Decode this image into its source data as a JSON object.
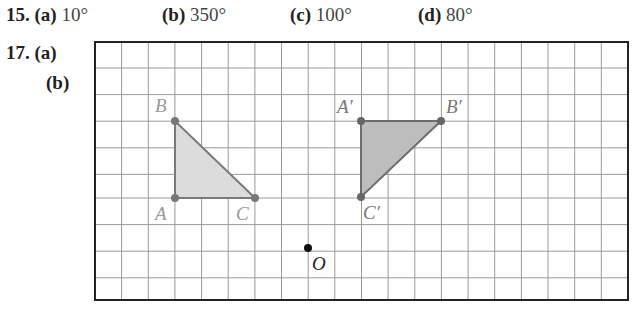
{
  "problem15": {
    "number": "15.",
    "parts": [
      {
        "label": "(a)",
        "answer": "10°"
      },
      {
        "label": "(b)",
        "answer": "350°"
      },
      {
        "label": "(c)",
        "answer": "100°"
      },
      {
        "label": "(d)",
        "answer": "80°"
      }
    ]
  },
  "problem17": {
    "number": "17.",
    "parts": [
      {
        "label": "(a)"
      },
      {
        "label": "(b)"
      }
    ]
  },
  "figure": {
    "grid": {
      "columns": 20,
      "rows": 10
    },
    "triangle_original": {
      "fill": "#dcdcdc",
      "points": [
        {
          "name": "A",
          "label": "A"
        },
        {
          "name": "B",
          "label": "B"
        },
        {
          "name": "C",
          "label": "C"
        }
      ]
    },
    "triangle_image": {
      "fill": "#bdbdbd",
      "points": [
        {
          "name": "A'",
          "label": "A′"
        },
        {
          "name": "B'",
          "label": "B′"
        },
        {
          "name": "C'",
          "label": "C′"
        }
      ]
    },
    "center": {
      "label": "O"
    }
  }
}
